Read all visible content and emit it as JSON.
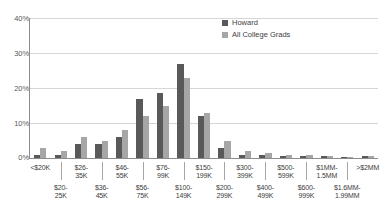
{
  "chart_data": {
    "type": "bar",
    "title": "",
    "subtitle": "",
    "xlabel": "",
    "ylabel": "",
    "ylim": [
      0,
      40
    ],
    "yticks": [
      "0%",
      "10%",
      "20%",
      "30%",
      "40%"
    ],
    "ytick_values": [
      0,
      10,
      20,
      30,
      40
    ],
    "grid": true,
    "legend_position": "top-right",
    "categories": [
      "<$20K",
      "$20-\n25K",
      "$26-\n35K",
      "$36-\n45K",
      "$46-\n55K",
      "$56-\n75K",
      "$76-\n99K",
      "$100-\n149K",
      "$150-\n199K",
      "$200-\n299K",
      "$300-\n399K",
      "$400-\n499K",
      "$500-\n599K",
      "$600-\n999K",
      "$1MM-\n1.5MM",
      "$1.6MM-\n1.99MM",
      ">$2MM"
    ],
    "series": [
      {
        "name": "Howard",
        "color": "#595959",
        "values": [
          1.0,
          1.0,
          4.0,
          4.0,
          6.0,
          17.0,
          18.5,
          27.0,
          12.0,
          3.0,
          1.0,
          0.8,
          0.5,
          0.5,
          0.5,
          0.3,
          0.5
        ]
      },
      {
        "name": "All College Grads",
        "color": "#a6a6a6",
        "values": [
          3.0,
          2.0,
          6.0,
          5.0,
          8.0,
          12.0,
          15.0,
          23.0,
          13.0,
          5.0,
          2.0,
          1.5,
          1.0,
          0.8,
          0.6,
          0.4,
          0.6
        ]
      }
    ]
  },
  "legend": {
    "items": [
      {
        "label": "Howard",
        "color": "#595959"
      },
      {
        "label": "All College Grads",
        "color": "#a6a6a6"
      }
    ]
  },
  "axes": {
    "y": {
      "ticks": [
        "40%",
        "30%",
        "20%",
        "10%",
        "0%"
      ]
    },
    "x": {
      "row0": [
        "<$20K",
        "$26-\n35K",
        "$46-\n55K",
        "$76-\n99K",
        "$150-\n199K",
        "$300-\n399K",
        "$500-\n599K",
        "$1MM-\n1.5MM",
        ">$2MM"
      ],
      "row1": [
        "$20-\n25K",
        "$36-\n45K",
        "$56-\n75K",
        "$100-\n149K",
        "$200-\n299K",
        "$400-\n499K",
        "$600-\n999K",
        "$1.6MM-\n1.99MM"
      ]
    }
  }
}
